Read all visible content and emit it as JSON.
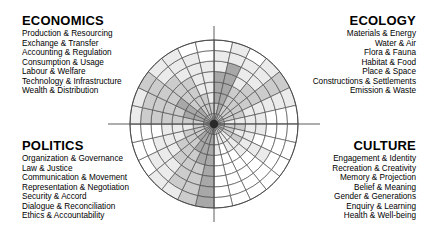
{
  "diagram": {
    "center": {
      "x": 214,
      "y": 124
    },
    "radius": 84,
    "rings": 8,
    "wedges_per_quadrant": 7,
    "stroke_color": "#4a4a4a",
    "background": "#ffffff"
  },
  "quadrants": {
    "economics": {
      "title": "ECONOMICS",
      "align": "left",
      "items": [
        "Production & Resourcing",
        "Exchange & Transfer",
        "Accounting & Regulation",
        "Consumption & Usage",
        "Labour & Welfare",
        "Technology & Infrastructure",
        "Wealth & Distribution"
      ]
    },
    "ecology": {
      "title": "ECOLOGY",
      "align": "right",
      "items": [
        "Materials & Energy",
        "Water & Air",
        "Flora & Fauna",
        "Habitat & Food",
        "Place & Space",
        "Constructions & Settlements",
        "Emission & Waste"
      ]
    },
    "politics": {
      "title": "POLITICS",
      "align": "left",
      "items": [
        "Organization & Governance",
        "Law & Justice",
        "Communication & Movement",
        "Representation & Negotiation",
        "Security & Accord",
        "Dialogue & Reconciliation",
        "Ethics & Accountability"
      ]
    },
    "culture": {
      "title": "CULTURE",
      "align": "right",
      "items": [
        "Engagement & Identity",
        "Recreation & Creativity",
        "Memory & Projection",
        "Belief & Meaning",
        "Gender & Generations",
        "Enquiry & Learning",
        "Health & Well-being"
      ]
    }
  },
  "chart_data": {
    "type": "heatmap",
    "subtype": "polar-grid",
    "rings": 8,
    "ring_index_from_center": [
      1,
      2,
      3,
      4,
      5,
      6,
      7,
      8
    ],
    "shade_scale": {
      "levels": [
        0,
        1,
        2,
        3,
        4
      ],
      "colors": [
        "#ffffff",
        "#ebebeb",
        "#cccccc",
        "#a8a8a8",
        "#8a8a8a"
      ],
      "meaning": "0 = lightest (vibrant) through 4 = darkest (critical)"
    },
    "categories": [
      "Production & Resourcing",
      "Exchange & Transfer",
      "Accounting & Regulation",
      "Consumption & Usage",
      "Labour & Welfare",
      "Technology & Infrastructure",
      "Wealth & Distribution",
      "Materials & Energy",
      "Water & Air",
      "Flora & Fauna",
      "Habitat & Food",
      "Place & Space",
      "Constructions & Settlements",
      "Emission & Waste",
      "Engagement & Identity",
      "Recreation & Creativity",
      "Memory & Projection",
      "Belief & Meaning",
      "Gender & Generations",
      "Enquiry & Learning",
      "Health & Well-being",
      "Organization & Governance",
      "Law & Justice",
      "Communication & Movement",
      "Representation & Negotiation",
      "Security & Accord",
      "Dialogue & Reconciliation",
      "Ethics & Accountability"
    ],
    "wedge_shades": [
      [
        2,
        2,
        3,
        3,
        3,
        1,
        1,
        0
      ],
      [
        3,
        3,
        3,
        3,
        3,
        3,
        1,
        1
      ],
      [
        2,
        2,
        2,
        2,
        1,
        1,
        1,
        0
      ],
      [
        2,
        2,
        2,
        2,
        2,
        1,
        1,
        1
      ],
      [
        3,
        2,
        2,
        2,
        2,
        2,
        2,
        2
      ],
      [
        2,
        2,
        2,
        1,
        1,
        1,
        1,
        1
      ],
      [
        2,
        1,
        1,
        1,
        1,
        0,
        0,
        0
      ],
      [
        3,
        2,
        2,
        1,
        1,
        0,
        0,
        0
      ],
      [
        2,
        2,
        1,
        1,
        0,
        0,
        0,
        0
      ],
      [
        3,
        2,
        2,
        1,
        1,
        1,
        0,
        0
      ],
      [
        2,
        1,
        1,
        1,
        0,
        0,
        0,
        0
      ],
      [
        2,
        1,
        1,
        0,
        0,
        0,
        0,
        0
      ],
      [
        1,
        1,
        0,
        0,
        0,
        0,
        0,
        0
      ],
      [
        1,
        1,
        1,
        0,
        0,
        0,
        0,
        0
      ],
      [
        4,
        3,
        3,
        3,
        3,
        3,
        3,
        3
      ],
      [
        3,
        3,
        3,
        3,
        2,
        2,
        2,
        2
      ],
      [
        3,
        3,
        3,
        2,
        2,
        2,
        2,
        1
      ],
      [
        3,
        3,
        2,
        2,
        2,
        1,
        1,
        1
      ],
      [
        3,
        2,
        2,
        2,
        1,
        1,
        1,
        0
      ],
      [
        2,
        2,
        2,
        1,
        1,
        1,
        0,
        0
      ],
      [
        2,
        2,
        1,
        1,
        1,
        0,
        0,
        0
      ],
      [
        3,
        2,
        2,
        2,
        2,
        2,
        2,
        1
      ],
      [
        3,
        3,
        3,
        2,
        2,
        2,
        2,
        1
      ],
      [
        3,
        3,
        3,
        3,
        2,
        2,
        2,
        2
      ],
      [
        3,
        3,
        2,
        2,
        2,
        2,
        1,
        1
      ],
      [
        2,
        2,
        2,
        2,
        2,
        1,
        1,
        1
      ],
      [
        2,
        2,
        2,
        1,
        1,
        1,
        1,
        0
      ],
      [
        2,
        2,
        1,
        1,
        1,
        1,
        0,
        0
      ]
    ],
    "xlabel": "",
    "ylabel": "",
    "grid": true,
    "legend": "none"
  }
}
